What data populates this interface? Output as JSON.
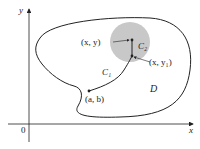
{
  "diagram": {
    "axes": {
      "x_label": "x",
      "y_label": "y",
      "origin_label": "0"
    },
    "region_label": "D",
    "points": [
      {
        "label": "(x, y)",
        "x": 131,
        "y": 40
      },
      {
        "label": "(x, y₁)",
        "x": 132,
        "y": 56
      },
      {
        "label": "(a, b)",
        "x": 89,
        "y": 91
      }
    ],
    "curves": [
      {
        "label": "C₁",
        "description": "path from (a, b) to (x, y₁)"
      },
      {
        "label": "C₂",
        "description": "vertical segment from (x, y₁) to (x, y)"
      }
    ],
    "disk": {
      "center_x": 130,
      "center_y": 42,
      "radius": 20,
      "color": "#c8c8c8"
    },
    "colors": {
      "line": "#222222",
      "disk": "#c8c8c8",
      "background": "#ffffff"
    }
  }
}
